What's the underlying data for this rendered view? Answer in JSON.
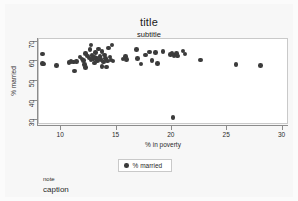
{
  "chart_data": {
    "type": "scatter",
    "title": "title",
    "subtitle": "subtitle",
    "note": "note",
    "caption": "caption",
    "xlabel": "% in poverty",
    "ylabel": "% married",
    "xlim": [
      8.0,
      30.4
    ],
    "ylim": [
      28.5,
      71.5
    ],
    "xticks": [
      10,
      15,
      20,
      25,
      30
    ],
    "yticks": [
      30,
      40,
      50,
      60,
      70
    ],
    "grid": false,
    "legend_position": "bottom-center",
    "marker_color": "#3b3b3b",
    "plot_background": "#ffffff",
    "figure_background": "#f7f7f7",
    "axis_color": "#8c8c8c",
    "series": [
      {
        "name": "% married",
        "points": [
          [
            8.3,
            63.9
          ],
          [
            8.3,
            59.1
          ],
          [
            8.4,
            58.6
          ],
          [
            9.6,
            57.8
          ],
          [
            10.7,
            59.5
          ],
          [
            10.9,
            59.9
          ],
          [
            11.1,
            59.7
          ],
          [
            11.2,
            55.1
          ],
          [
            11.4,
            60.0
          ],
          [
            11.7,
            62.3
          ],
          [
            11.9,
            61.2
          ],
          [
            12.0,
            60.4
          ],
          [
            12.1,
            58.3
          ],
          [
            12.2,
            64.0
          ],
          [
            12.2,
            57.0
          ],
          [
            12.4,
            62.8
          ],
          [
            12.5,
            61.7
          ],
          [
            12.6,
            66.0
          ],
          [
            12.7,
            68.4
          ],
          [
            12.7,
            60.9
          ],
          [
            12.8,
            63.2
          ],
          [
            12.9,
            61.3
          ],
          [
            13.0,
            62.0
          ],
          [
            13.0,
            59.3
          ],
          [
            13.1,
            64.5
          ],
          [
            13.2,
            61.8
          ],
          [
            13.3,
            60.6
          ],
          [
            13.4,
            66.3
          ],
          [
            13.5,
            62.5
          ],
          [
            13.6,
            61.0
          ],
          [
            13.7,
            65.0
          ],
          [
            13.7,
            57.5
          ],
          [
            13.8,
            59.8
          ],
          [
            13.9,
            63.4
          ],
          [
            14.0,
            61.4
          ],
          [
            14.1,
            57.2
          ],
          [
            14.2,
            60.2
          ],
          [
            14.3,
            66.8
          ],
          [
            14.4,
            62.2
          ],
          [
            14.5,
            60.7
          ],
          [
            14.6,
            68.5
          ],
          [
            14.7,
            60.3
          ],
          [
            15.6,
            61.2
          ],
          [
            15.8,
            62.4
          ],
          [
            15.9,
            60.9
          ],
          [
            16.8,
            66.1
          ],
          [
            16.9,
            61.5
          ],
          [
            17.2,
            58.8
          ],
          [
            17.6,
            63.3
          ],
          [
            18.0,
            64.8
          ],
          [
            18.2,
            60.6
          ],
          [
            18.5,
            64.7
          ],
          [
            18.7,
            59.1
          ],
          [
            19.2,
            65.2
          ],
          [
            19.9,
            63.6
          ],
          [
            20.0,
            64.0
          ],
          [
            20.1,
            31.4
          ],
          [
            20.2,
            63.0
          ],
          [
            20.4,
            64.1
          ],
          [
            20.5,
            62.8
          ],
          [
            21.0,
            65.4
          ],
          [
            21.2,
            63.9
          ],
          [
            22.6,
            60.7
          ],
          [
            25.8,
            58.3
          ],
          [
            28.0,
            57.9
          ]
        ]
      }
    ]
  }
}
